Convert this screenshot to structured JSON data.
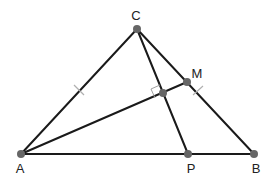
{
  "diagram": {
    "type": "geometry",
    "points": {
      "A": {
        "label": "A",
        "x": 21,
        "y": 154
      },
      "B": {
        "label": "B",
        "x": 254,
        "y": 154
      },
      "C": {
        "label": "C",
        "x": 137,
        "y": 29
      },
      "M": {
        "label": "M",
        "x": 187,
        "y": 82
      },
      "P": {
        "label": "P",
        "x": 188,
        "y": 154
      },
      "H": {
        "label": "",
        "x": 163,
        "y": 93
      }
    },
    "segments": [
      {
        "from": "A",
        "to": "B"
      },
      {
        "from": "A",
        "to": "C"
      },
      {
        "from": "C",
        "to": "B"
      },
      {
        "from": "C",
        "to": "P"
      },
      {
        "from": "A",
        "to": "M"
      }
    ],
    "annotations": {
      "equal_ticks": [
        "AC",
        "CB"
      ],
      "right_angle_at": "H"
    },
    "colors": {
      "line": "#1a1a1a",
      "point": "#666666",
      "tick": "#b0b0b0",
      "label": "#222222"
    }
  }
}
